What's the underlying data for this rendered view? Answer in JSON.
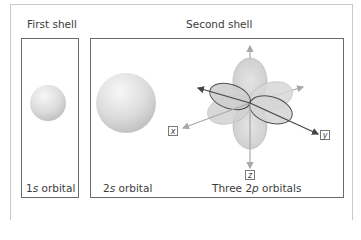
{
  "figure": {
    "first_shell": {
      "title": "First shell",
      "orbital_caption_num": "1",
      "orbital_caption_letter": "s",
      "orbital_caption_rest": " orbital"
    },
    "second_shell": {
      "title": "Second shell",
      "s_caption_num": "2",
      "s_caption_letter": "s",
      "s_caption_rest": " orbital",
      "p_caption_pre": "Three 2",
      "p_caption_letter": "p",
      "p_caption_rest": " orbitals"
    },
    "axes": {
      "x": "x",
      "y": "y",
      "z": "z"
    },
    "colors": {
      "frame": "#6a6a6a",
      "card_border": "#c9c9c9",
      "sphere_light": "#f2f2f2",
      "sphere_dark": "#c4c4c4",
      "lobe_fill": "#d6d6d6",
      "lobe_outline": "#3d3d3d",
      "axis_gray": "#a8a8a8",
      "axis_dark": "#444444"
    }
  }
}
